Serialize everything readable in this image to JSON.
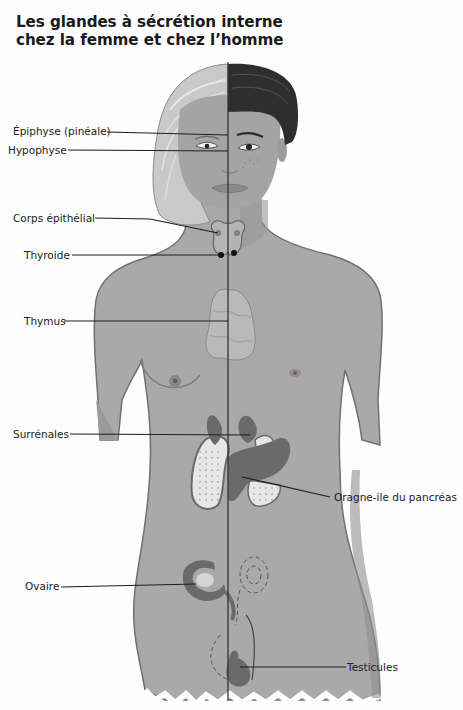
{
  "title": {
    "line1": "Les glandes à sécrétion interne",
    "line2": "chez la femme et chez l’homme"
  },
  "labels": [
    {
      "id": "epiphyse",
      "text": "Épiphyse (pinéale)"
    },
    {
      "id": "hypophyse",
      "text": "Hypophyse"
    },
    {
      "id": "corps-epithelial",
      "text": "Corps épithélial"
    },
    {
      "id": "thyroide",
      "text": "Thyroide"
    },
    {
      "id": "thymus",
      "text": "Thymus"
    },
    {
      "id": "surrenales",
      "text": "Surrénales"
    },
    {
      "id": "pancreas",
      "text": "Oragne-ile du pancréas"
    },
    {
      "id": "ovaire",
      "text": "Ovaire"
    },
    {
      "id": "testicules",
      "text": "Testicules"
    }
  ],
  "colors": {
    "skin": "#a9a9a9",
    "skin_dark": "#8f8f8f",
    "hair_female": "#c9c9c9",
    "hair_male": "#2e2e2e",
    "organ_dark": "#6a6a6a",
    "organ_light": "#e6e6e6",
    "line": "#222222"
  }
}
